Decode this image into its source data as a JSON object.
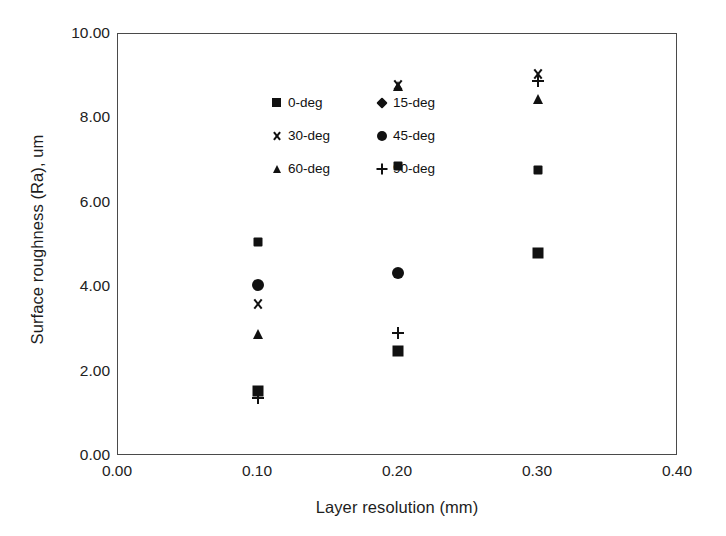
{
  "chart_data": {
    "type": "scatter",
    "title": "",
    "xlabel": "Layer resolution (mm)",
    "ylabel": "Surface roughness (Ra), um",
    "xlim": [
      0.0,
      0.4
    ],
    "ylim": [
      0.0,
      10.0
    ],
    "xticks": [
      "0.00",
      "0.10",
      "0.20",
      "0.30",
      "0.40"
    ],
    "xtick_values": [
      0.0,
      0.1,
      0.2,
      0.3,
      0.4
    ],
    "yticks": [
      "0.00",
      "2.00",
      "4.00",
      "6.00",
      "8.00",
      "10.00"
    ],
    "ytick_values": [
      0,
      2,
      4,
      6,
      8,
      10
    ],
    "grid": false,
    "legend_position": "upper-left-inside",
    "x": [
      0.1,
      0.2,
      0.3
    ],
    "series": [
      {
        "name": "0-deg",
        "marker": "square",
        "values": [
          1.55,
          2.5,
          4.8
        ]
      },
      {
        "name": "15-deg",
        "marker": "diamond",
        "values": [
          5.07,
          6.88,
          6.78
        ]
      },
      {
        "name": "30-deg",
        "marker": "cross",
        "values": [
          3.6,
          8.78,
          9.05
        ]
      },
      {
        "name": "45-deg",
        "marker": "circle",
        "values": [
          4.05,
          4.33,
          null
        ]
      },
      {
        "name": "60-deg",
        "marker": "triangle",
        "values": [
          2.88,
          8.76,
          8.45
        ]
      },
      {
        "name": "90-deg",
        "marker": "plus",
        "values": [
          1.38,
          2.92,
          8.88
        ]
      }
    ]
  },
  "legend": {
    "items": [
      {
        "label": "0-deg",
        "marker": "square"
      },
      {
        "label": "15-deg",
        "marker": "diamond"
      },
      {
        "label": "30-deg",
        "marker": "cross"
      },
      {
        "label": "45-deg",
        "marker": "circle"
      },
      {
        "label": "60-deg",
        "marker": "triangle"
      },
      {
        "label": "90-deg",
        "marker": "plus"
      }
    ]
  },
  "colors": {
    "marker": "#111111",
    "axis": "#4a4a4a",
    "text": "#1d1d1d",
    "background": "#ffffff"
  }
}
